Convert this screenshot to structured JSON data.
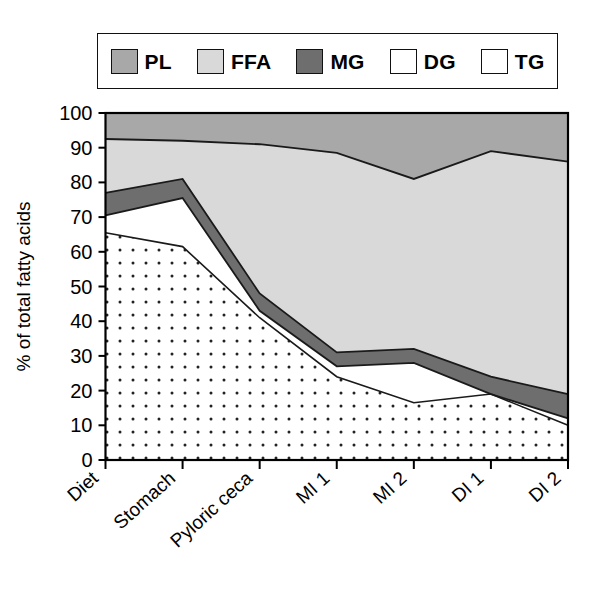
{
  "chart_data": {
    "type": "area",
    "title": "",
    "xlabel": "",
    "ylabel": "% of total fatty acids",
    "ylim": [
      0,
      100
    ],
    "ytick_labels": [
      "0",
      "10",
      "20",
      "30",
      "40",
      "50",
      "60",
      "70",
      "80",
      "90",
      "100"
    ],
    "ytick_values": [
      0,
      10,
      20,
      30,
      40,
      50,
      60,
      70,
      80,
      90,
      100
    ],
    "grid": false,
    "stacked": true,
    "stack_order_bottom_to_top": [
      "TG",
      "DG",
      "MG",
      "FFA",
      "PL"
    ],
    "legend_position": "top",
    "categories": [
      "Diet",
      "Stomach",
      "Pyloric ceca",
      "MI 1",
      "MI 2",
      "DI 1",
      "DI 2"
    ],
    "series": [
      {
        "name": "TG",
        "fill": "#ffffff",
        "pattern": "dots",
        "values": [
          65.5,
          61.5,
          41.0,
          24.0,
          16.5,
          19.0,
          10.0
        ]
      },
      {
        "name": "DG",
        "fill": "#ffffff",
        "pattern": "none",
        "values": [
          5.0,
          14.0,
          2.0,
          3.0,
          11.5,
          0.0,
          2.0
        ]
      },
      {
        "name": "MG",
        "fill": "#6e6e6e",
        "pattern": "none",
        "values": [
          6.5,
          5.5,
          5.0,
          4.0,
          4.0,
          5.0,
          7.0
        ]
      },
      {
        "name": "FFA",
        "fill": "#d9d9d9",
        "pattern": "none",
        "values": [
          15.5,
          11.0,
          39.0,
          57.5,
          49.0,
          65.0,
          67.0
        ]
      },
      {
        "name": "PL",
        "fill": "#a8a8a8",
        "pattern": "none",
        "values": [
          7.5,
          8.0,
          9.0,
          11.5,
          19.0,
          11.0,
          13.5
        ]
      }
    ],
    "cumulative_tops": {
      "TG": [
        65.5,
        61.5,
        41.0,
        24.0,
        16.5,
        19.0,
        10.0
      ],
      "DG": [
        70.5,
        75.5,
        43.0,
        27.0,
        28.0,
        19.0,
        12.0
      ],
      "MG": [
        77.0,
        81.0,
        48.0,
        31.0,
        32.0,
        24.0,
        19.0
      ],
      "FFA": [
        92.5,
        92.0,
        91.0,
        88.5,
        81.0,
        89.0,
        86.0
      ],
      "PL": [
        100,
        100,
        100,
        100,
        100,
        100,
        100
      ]
    },
    "legend": [
      {
        "key": "PL",
        "label": "PL",
        "fill": "#a8a8a8",
        "pattern": "none"
      },
      {
        "key": "FFA",
        "label": "FFA",
        "fill": "#d9d9d9",
        "pattern": "none"
      },
      {
        "key": "MG",
        "label": "MG",
        "fill": "#6e6e6e",
        "pattern": "none"
      },
      {
        "key": "DG",
        "label": "DG",
        "fill": "#ffffff",
        "pattern": "none"
      },
      {
        "key": "TG",
        "label": "TG",
        "fill": "#ffffff",
        "pattern": "dots"
      }
    ],
    "colors": {
      "PL": "#a8a8a8",
      "FFA": "#d9d9d9",
      "MG": "#6e6e6e",
      "DG": "#ffffff",
      "TG": "#ffffff",
      "axis": "#000000",
      "outline": "#1a1a1a",
      "background": "#ffffff"
    }
  }
}
